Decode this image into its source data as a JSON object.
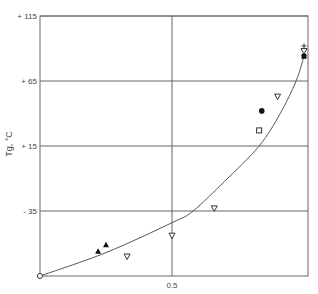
{
  "chart_data": {
    "type": "scatter",
    "title": "",
    "xlabel": "",
    "ylabel": "Tg, °C",
    "xlim": [
      0,
      1.0
    ],
    "ylim": [
      -85,
      115
    ],
    "x_ticks": [
      {
        "value": 0.5,
        "label": "0.5"
      }
    ],
    "y_ticks": [
      {
        "value": 115,
        "label": "+ 115"
      },
      {
        "value": 65,
        "label": "+ 65"
      },
      {
        "value": 15,
        "label": "+ 15"
      },
      {
        "value": -35,
        "label": "- 35"
      }
    ],
    "grid": true,
    "legend": null,
    "series": [
      {
        "name": "open-circle",
        "marker": "circle-open",
        "points": [
          [
            0.0,
            -85
          ]
        ]
      },
      {
        "name": "filled-triangle-up",
        "marker": "triangle-up-filled",
        "points": [
          [
            0.22,
            -66
          ],
          [
            0.25,
            -61
          ]
        ]
      },
      {
        "name": "open-triangle-down",
        "marker": "triangle-down-open",
        "points": [
          [
            0.33,
            -70
          ],
          [
            0.5,
            -54
          ],
          [
            0.66,
            -33
          ],
          [
            0.9,
            53
          ],
          [
            1.0,
            88
          ]
        ]
      },
      {
        "name": "open-square",
        "marker": "square-open",
        "points": [
          [
            0.83,
            27
          ]
        ]
      },
      {
        "name": "filled-circle",
        "marker": "circle-filled",
        "points": [
          [
            0.84,
            42
          ]
        ]
      },
      {
        "name": "plus",
        "marker": "plus",
        "points": [
          [
            1.0,
            92
          ]
        ]
      },
      {
        "name": "filled-square",
        "marker": "square-filled",
        "points": [
          [
            1.0,
            84
          ]
        ]
      },
      {
        "name": "fitted-curve",
        "type": "line",
        "points": [
          [
            0.0,
            -85
          ],
          [
            0.25,
            -67
          ],
          [
            0.5,
            -44
          ],
          [
            0.58,
            -35
          ],
          [
            0.7,
            -12
          ],
          [
            0.83,
            15
          ],
          [
            0.91,
            40
          ],
          [
            0.97,
            65
          ],
          [
            1.0,
            84
          ]
        ]
      }
    ]
  }
}
